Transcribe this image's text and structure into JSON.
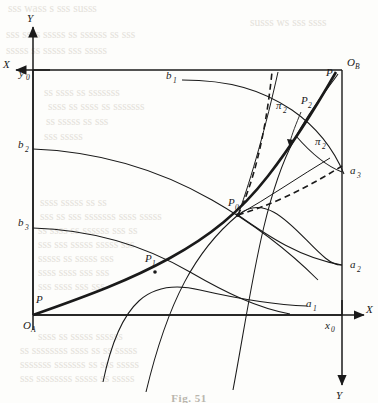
{
  "figure": {
    "caption": "Fig. 51",
    "axes": {
      "top_left_x_label": "X",
      "top_left_y_label": "Y",
      "origin_a_label": "O",
      "origin_a_sub": "A",
      "origin_b_label": "O",
      "origin_b_sub": "B",
      "bottom_x_label": "X",
      "bottom_y_label": "Y",
      "x0_label": "x",
      "x0_sub": "0",
      "y0_label": "y",
      "y0_sub": "0"
    },
    "curve_labels": [
      {
        "id": "b1",
        "base": "b",
        "sub": "1",
        "x": 166,
        "y": 79
      },
      {
        "id": "b2",
        "base": "b",
        "sub": "2",
        "x": 18,
        "y": 148
      },
      {
        "id": "b3",
        "base": "b",
        "sub": "3",
        "x": 18,
        "y": 226
      },
      {
        "id": "a1",
        "base": "a",
        "sub": "1",
        "x": 306,
        "y": 307
      },
      {
        "id": "a2",
        "base": "a",
        "sub": "2",
        "x": 350,
        "y": 268
      },
      {
        "id": "a3",
        "base": "a",
        "sub": "3",
        "x": 350,
        "y": 174
      },
      {
        "id": "P0",
        "base": "P",
        "sub": "0",
        "x": 228,
        "y": 206
      },
      {
        "id": "P1",
        "base": "P",
        "sub": "1",
        "x": 145,
        "y": 262
      },
      {
        "id": "P2",
        "base": "P",
        "sub": "2",
        "x": 301,
        "y": 104
      },
      {
        "id": "P-top",
        "base": "P",
        "sub": "",
        "x": 326,
        "y": 76
      },
      {
        "id": "P-bottom",
        "base": "P",
        "sub": "",
        "x": 36,
        "y": 303
      },
      {
        "id": "pi2-upper",
        "base": "π",
        "sub": "2",
        "x": 276,
        "y": 109
      },
      {
        "id": "pi2-lower",
        "base": "π",
        "sub": "2",
        "x": 315,
        "y": 145
      }
    ],
    "colors": {
      "ink": "#1a1a1a",
      "paper": "#fdfdfb",
      "faded_text": "#e4e1da"
    },
    "box": {
      "left": 33,
      "top": 70,
      "right": 342,
      "bottom": 315
    },
    "bleed_text": [
      {
        "t": "sss wass s sss susss",
        "x": 8,
        "y": 2
      },
      {
        "t": "susss ws sss ssss",
        "x": 250,
        "y": 16
      },
      {
        "t": "sss ssss sssss ss ssssss ss sss",
        "x": 6,
        "y": 28
      },
      {
        "t": "sssss ss sssss sss sssss",
        "x": 6,
        "y": 44
      },
      {
        "t": "ss ssss ss sssssss",
        "x": 44,
        "y": 86
      },
      {
        "t": "ssss ss ssss ss sssssss",
        "x": 48,
        "y": 100
      },
      {
        "t": "ss sssss ss sss",
        "x": 46,
        "y": 115
      },
      {
        "t": "sss sssss",
        "x": 44,
        "y": 130
      },
      {
        "t": "ssss sssss ss ss",
        "x": 40,
        "y": 196
      },
      {
        "t": "sss ss sss sssssss ssss sssss",
        "x": 40,
        "y": 210
      },
      {
        "t": "ss ssss ss ssssss sss ss",
        "x": 38,
        "y": 224
      },
      {
        "t": "sss sss sssss sssss sss",
        "x": 38,
        "y": 238
      },
      {
        "t": "sssss ss sssss sss",
        "x": 38,
        "y": 252
      },
      {
        "t": "ssss ssss sss sss",
        "x": 38,
        "y": 266
      },
      {
        "t": "sss ssss sss sss",
        "x": 38,
        "y": 280
      },
      {
        "t": "ssss ss sssss ssssss",
        "x": 38,
        "y": 330
      },
      {
        "t": "ss ssssssss ssss ss ss sssss",
        "x": 20,
        "y": 344
      },
      {
        "t": "sssssss sssssss ss sss sssss",
        "x": 20,
        "y": 358
      },
      {
        "t": "sss ssssssss sssss ss sssss",
        "x": 20,
        "y": 372
      }
    ]
  }
}
